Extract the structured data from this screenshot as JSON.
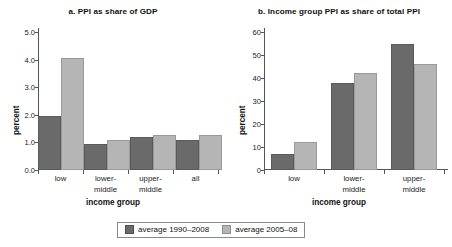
{
  "chart_data": [
    {
      "type": "bar",
      "panel": "a",
      "title": "a. PPI as share of GDP",
      "xlabel": "income group",
      "ylabel": "percent",
      "categories": [
        "low",
        "lower-\nmiddle",
        "upper-\nmiddle",
        "all"
      ],
      "category_lines": [
        [
          "low"
        ],
        [
          "lower-",
          "middle"
        ],
        [
          "upper-",
          "middle"
        ],
        [
          "all"
        ]
      ],
      "ylim": [
        0.0,
        5.0
      ],
      "yticks": [
        "0.0",
        "1.0",
        "2.0",
        "3.0",
        "4.0",
        "5.0"
      ],
      "ytick_values": [
        0.0,
        1.0,
        2.0,
        3.0,
        4.0,
        5.0
      ],
      "grid": false,
      "legend_position": "bottom",
      "series": [
        {
          "name": "average 1990–2008",
          "color": "#6a6a6a",
          "values": [
            1.97,
            0.95,
            1.2,
            1.08
          ]
        },
        {
          "name": "average 2005–08",
          "color": "#b5b5b5",
          "values": [
            4.05,
            1.07,
            1.26,
            1.26
          ]
        }
      ]
    },
    {
      "type": "bar",
      "panel": "b",
      "title": "b. Income group PPI as share of total PPI",
      "xlabel": "income group",
      "ylabel": "percent",
      "categories": [
        "low",
        "lower-\nmiddle",
        "upper-\nmiddle"
      ],
      "category_lines": [
        [
          "low"
        ],
        [
          "lower-",
          "middle"
        ],
        [
          "upper-",
          "middle"
        ]
      ],
      "ylim": [
        0,
        60
      ],
      "yticks": [
        "0",
        "10",
        "20",
        "30",
        "40",
        "50",
        "60"
      ],
      "ytick_values": [
        0,
        10,
        20,
        30,
        40,
        50,
        60
      ],
      "grid": false,
      "legend_position": "bottom",
      "series": [
        {
          "name": "average 1990–2008",
          "color": "#6a6a6a",
          "values": [
            7,
            38,
            55
          ]
        },
        {
          "name": "average 2005–08",
          "color": "#b5b5b5",
          "values": [
            12,
            42,
            46
          ]
        }
      ]
    }
  ],
  "legend": {
    "items": [
      {
        "label": "average 1990–2008",
        "color": "#6a6a6a"
      },
      {
        "label": "average 2005–08",
        "color": "#b5b5b5"
      }
    ]
  },
  "colors": {
    "series_1": "#6a6a6a",
    "series_2": "#b5b5b5",
    "axis": "#555555",
    "text": "#111111",
    "background": "#ffffff"
  }
}
